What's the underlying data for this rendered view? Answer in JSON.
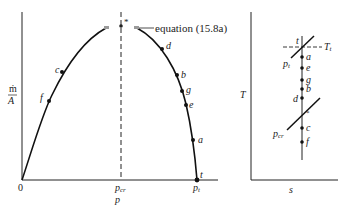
{
  "left_diagram": {
    "y_label_top": "ṁ",
    "y_label_bottom": "A",
    "x_label": "p",
    "origin_label": "0",
    "pcr_label": "p",
    "pcr_sub": "cr",
    "pt_label": "p",
    "pt_sub": "t",
    "star_label": "*",
    "equation_label": "equation (15.8a)",
    "curve_points": [
      {
        "name": "f",
        "label": "f"
      },
      {
        "name": "c",
        "label": "c"
      },
      {
        "name": "d",
        "label": "d"
      },
      {
        "name": "b",
        "label": "b"
      },
      {
        "name": "g",
        "label": "g"
      },
      {
        "name": "e",
        "label": "e"
      },
      {
        "name": "a",
        "label": "a"
      },
      {
        "name": "t",
        "label": "t"
      }
    ]
  },
  "right_diagram": {
    "y_label": "T",
    "x_label": "s",
    "t_label": "t",
    "Tt_label": "T",
    "Tt_sub": "t",
    "pt_label": "p",
    "pt_sub": "t",
    "pcr_label": "p",
    "pcr_sub": "cr",
    "star_label": "*",
    "points": [
      {
        "name": "a",
        "label": "a"
      },
      {
        "name": "e",
        "label": "e"
      },
      {
        "name": "g",
        "label": "g"
      },
      {
        "name": "b",
        "label": "b"
      },
      {
        "name": "d",
        "label": "d"
      },
      {
        "name": "c",
        "label": "c"
      },
      {
        "name": "f",
        "label": "f"
      }
    ]
  },
  "colors": {
    "ink": "#222222",
    "marker_gray": "#9a9a9a"
  }
}
